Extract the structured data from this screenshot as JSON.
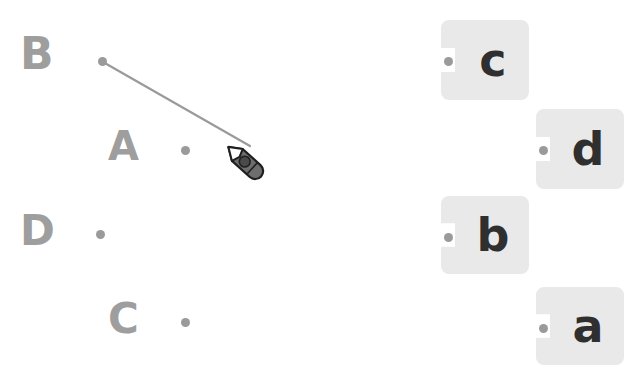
{
  "canvas": {
    "width": 638,
    "height": 381,
    "background": "#ffffff"
  },
  "colors": {
    "prompt_text": "#9e9e9e",
    "dot": "#9a9a9a",
    "card_fill": "#e9e9e9",
    "card_letter": "#2f2f2f",
    "line": "#9a9a9a",
    "pencil_body": "#6e6e6e",
    "pencil_outline": "#1f1f1f"
  },
  "prompts": [
    {
      "label": "B",
      "x": 20,
      "y": 32,
      "font_size": 44,
      "dot_x": 98,
      "dot_y": 57
    },
    {
      "label": "A",
      "x": 108,
      "y": 126,
      "font_size": 40,
      "dot_x": 181,
      "dot_y": 146
    },
    {
      "label": "D",
      "x": 20,
      "y": 210,
      "font_size": 42,
      "dot_x": 96,
      "dot_y": 230
    },
    {
      "label": "C",
      "x": 108,
      "y": 298,
      "font_size": 42,
      "dot_x": 181,
      "dot_y": 318
    }
  ],
  "answers": [
    {
      "label": "c",
      "x": 441,
      "y": 20,
      "width": 88,
      "height": 80,
      "dot_x": 444,
      "dot_y": 57
    },
    {
      "label": "d",
      "x": 536,
      "y": 109,
      "width": 88,
      "height": 80,
      "dot_x": 539,
      "dot_y": 146
    },
    {
      "label": "b",
      "x": 441,
      "y": 196,
      "width": 88,
      "height": 78,
      "dot_x": 444,
      "dot_y": 233
    },
    {
      "label": "a",
      "x": 536,
      "y": 287,
      "width": 88,
      "height": 78,
      "dot_x": 539,
      "dot_y": 324
    }
  ],
  "connection": {
    "from_label": "B",
    "to_label": "pencil-tip",
    "x1": 103,
    "y1": 62,
    "x2": 250,
    "y2": 146,
    "stroke_width": 2.2
  },
  "cursor": {
    "icon": "pencil-icon",
    "tip_x": 250,
    "tip_y": 146,
    "x": 221,
    "y": 138
  }
}
